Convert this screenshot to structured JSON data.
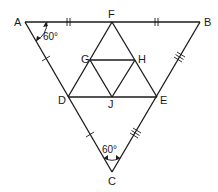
{
  "diagram": {
    "type": "geometry",
    "points": {
      "A": {
        "label": "A",
        "x": 25,
        "y": 22
      },
      "B": {
        "label": "B",
        "x": 200,
        "y": 22
      },
      "C": {
        "label": "C",
        "x": 112,
        "y": 172
      },
      "F": {
        "label": "F",
        "x": 112,
        "y": 22
      },
      "D": {
        "label": "D",
        "x": 68,
        "y": 97
      },
      "E": {
        "label": "E",
        "x": 157,
        "y": 97
      },
      "G": {
        "label": "G",
        "x": 90,
        "y": 60
      },
      "H": {
        "label": "H",
        "x": 135,
        "y": 60
      },
      "J": {
        "label": "J",
        "x": 112,
        "y": 97
      }
    },
    "angles": {
      "A": "60°",
      "C": "60°"
    },
    "segments": [
      "AB",
      "BC",
      "CA",
      "DE",
      "DF",
      "FE",
      "GH",
      "GJ",
      "HJ"
    ],
    "tick_marks": {
      "AF": "double",
      "FB": "double",
      "AD": "single",
      "DC": "single",
      "BE": "triple",
      "EC": "triple"
    },
    "stroke_color": "#1a1a1a",
    "background": "#ffffff"
  }
}
